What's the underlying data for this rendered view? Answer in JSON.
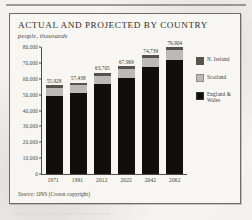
{
  "page": {
    "background_color": "#f3f2ef",
    "rule_color": "#8d8a84",
    "ghost_text_top": "lorem ipsum dolor sit amet consectetur",
    "ghost_text_bottom": "adipiscing elit sed do eiusmod tempor incididunt"
  },
  "figure": {
    "title": "ACTUAL AND PROJECTED BY COUNTRY",
    "subtitle": "people, thousands",
    "source_prefix": "Source:",
    "source_text": "ONS (Crown copyright)",
    "border_color": "#6e6b65",
    "panel_color": "#f7f6f3"
  },
  "legend": {
    "position": "right",
    "items": [
      {
        "label": "N. Ireland",
        "color": "#56534f"
      },
      {
        "label": "Scotland",
        "color": "#bcbab6"
      },
      {
        "label": "England & Wales",
        "color": "#100f0e"
      }
    ]
  },
  "chart_data": {
    "type": "bar",
    "stacked": true,
    "title": "ACTUAL AND PROJECTED BY COUNTRY",
    "subtitle": "people, thousands",
    "xlabel": "",
    "ylabel": "people, thousands",
    "ylim": [
      0,
      80000
    ],
    "ytick_step": 10000,
    "grid": false,
    "ytick_labels": [
      "0",
      "10,000",
      "20,000",
      "30,000",
      "40,000",
      "50,000",
      "60,000",
      "70,000",
      "80,000"
    ],
    "ytick_values": [
      0,
      10000,
      20000,
      30000,
      40000,
      50000,
      60000,
      70000,
      80000
    ],
    "categories": [
      "1971",
      "1991",
      "2012",
      "2022",
      "2042",
      "2062"
    ],
    "series": [
      {
        "name": "England & Wales",
        "color": "#100f0e",
        "values": [
          49152,
          51100,
          56567,
          60700,
          67100,
          71900
        ]
      },
      {
        "name": "Scotland",
        "color": "#bcbab6",
        "values": [
          5236,
          5083,
          5314,
          5500,
          5800,
          6000
        ]
      },
      {
        "name": "N. Ireland",
        "color": "#56534f",
        "values": [
          1540,
          1255,
          1824,
          1769,
          1839,
          2004
        ]
      }
    ],
    "totals": [
      55928,
      57438,
      63705,
      67969,
      74739,
      79904
    ],
    "total_labels": [
      "55,928",
      "57,438",
      "63,705",
      "67,969",
      "74,739",
      "79,904"
    ],
    "source": "Source: ONS (Crown copyright)"
  }
}
